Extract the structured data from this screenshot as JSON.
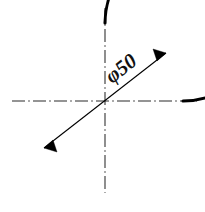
{
  "drawing": {
    "title": "Circle with diameter dimension",
    "background_color": "#ffffff",
    "line_color": "#000000",
    "centerline_color": "#2b2b2b",
    "canvas": {
      "width": 205,
      "height": 212
    },
    "circle": {
      "name": "circle-outline",
      "center_x": 105,
      "center_y": 101,
      "radius": 78,
      "stroke_width": 3.1,
      "arc_start_deg": 0,
      "arc_end_deg": 270,
      "arc_sweep_deg": 270,
      "path": "M 183 101 A 78 78 0 1 0 105 179"
    },
    "centerlines": {
      "horizontal": {
        "name": "horizontal-centerline",
        "x1": 12,
        "y1": 101,
        "x2": 197,
        "y2": 101
      },
      "vertical": {
        "name": "vertical-centerline",
        "x1": 105,
        "y1": 8,
        "x2": 105,
        "y2": 193
      }
    },
    "dimension": {
      "name": "diameter-dimension",
      "label": "φ50",
      "symbol": "φ",
      "value": "50",
      "rotation_deg": -38,
      "text_x": 112,
      "text_y": 84,
      "line": {
        "x1": 44,
        "y1": 148,
        "x2": 166,
        "y2": 53,
        "angle_deg": -37.9
      },
      "arrowheads": [
        {
          "name": "arrowhead-lower-left",
          "tip_x": 44,
          "tip_y": 148,
          "points": "44,148 57,152 53,140"
        },
        {
          "name": "arrowhead-upper-right",
          "tip_x": 166,
          "tip_y": 53,
          "points": "166,53 153,49 157,61"
        }
      ]
    }
  }
}
